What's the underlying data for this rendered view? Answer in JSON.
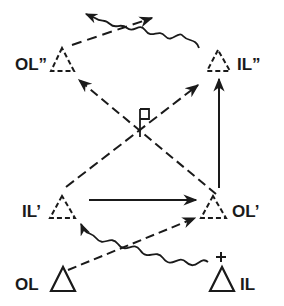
{
  "diagram": {
    "nodes": [
      {
        "id": "OL",
        "label": "OL",
        "style": "solid",
        "position": "bottom-left"
      },
      {
        "id": "IL",
        "label": "IL",
        "style": "solid",
        "position": "bottom-right",
        "charge": "+"
      },
      {
        "id": "IL1",
        "label": "IL’",
        "style": "dashed",
        "position": "middle-left"
      },
      {
        "id": "OL1",
        "label": "OL’",
        "style": "dashed",
        "position": "middle-right"
      },
      {
        "id": "OL2",
        "label": "OL”",
        "style": "dashed",
        "position": "top-left"
      },
      {
        "id": "IL2",
        "label": "IL”",
        "style": "dashed",
        "position": "top-right"
      }
    ],
    "edges": [
      {
        "from": "OL",
        "to": "OL1",
        "style": "dashed",
        "arrow": true
      },
      {
        "from": "IL",
        "to": "IL1",
        "style": "wavy",
        "arrow": true
      },
      {
        "from": "IL1",
        "to": "OL1",
        "style": "solid",
        "arrow": true
      },
      {
        "from": "OL1",
        "to": "IL2",
        "style": "solid",
        "arrow": true
      },
      {
        "from": "OL1",
        "to": "OL2",
        "style": "dashed",
        "arrow": true
      },
      {
        "from": "IL1",
        "to": "IL2",
        "style": "dashed",
        "arrow": true
      },
      {
        "from": "OL2",
        "to": "out-right",
        "style": "dashed",
        "arrow": true
      },
      {
        "from": "IL2",
        "to": "out-left",
        "style": "wavy",
        "arrow": true
      }
    ],
    "marker": {
      "name": "flag",
      "position": "crossing-center"
    },
    "charge_symbol": "+"
  }
}
